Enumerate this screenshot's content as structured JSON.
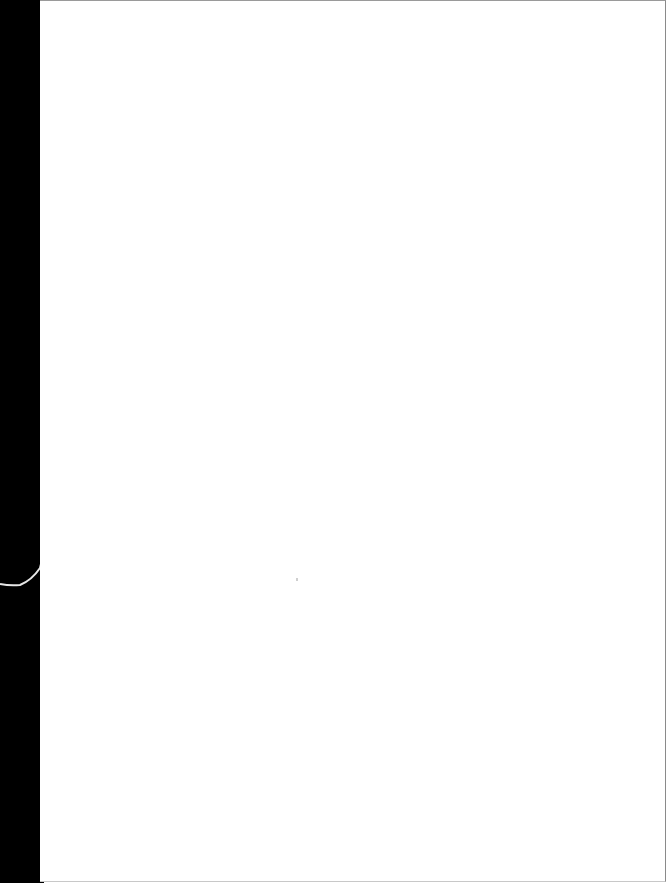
{
  "document": {
    "type": "scanned-page",
    "content": "",
    "colors": {
      "page": "#ffffff",
      "scan_edge": "#000000",
      "border": "#9a9a9a"
    }
  }
}
